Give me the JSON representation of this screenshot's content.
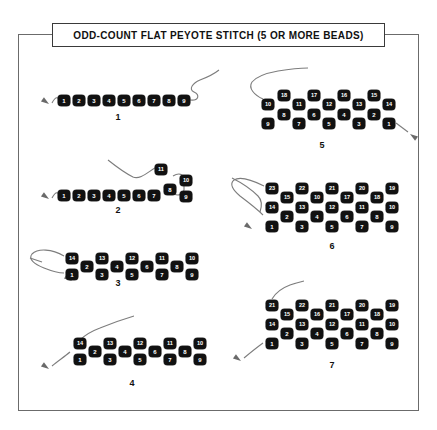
{
  "page": {
    "title": "ODD-COUNT FLAT PEYOTE STITCH (5 OR MORE BEADS)",
    "background_color": "#ffffff",
    "frame_color": "#6b6b6b",
    "bead_color": "#111111",
    "bead_label_color": "#ffffff",
    "thread_color": "#7d7d7d"
  },
  "steps": [
    {
      "number": "1",
      "label_x": 106,
      "label_y": 112,
      "beads": [
        {
          "n": "1",
          "x": 58,
          "y": 95
        },
        {
          "n": "2",
          "x": 73,
          "y": 95
        },
        {
          "n": "3",
          "x": 88,
          "y": 95
        },
        {
          "n": "4",
          "x": 103,
          "y": 95
        },
        {
          "n": "5",
          "x": 118,
          "y": 95
        },
        {
          "n": "6",
          "x": 133,
          "y": 95
        },
        {
          "n": "7",
          "x": 148,
          "y": 95
        },
        {
          "n": "8",
          "x": 163,
          "y": 95
        },
        {
          "n": "9",
          "x": 178,
          "y": 95
        }
      ],
      "threads": [
        "M52,103 C54,99 56,97 58,98",
        "M190,100 C199,101 200,95 194,92 C188,89 193,83 200,80 C208,77 214,74 219,70"
      ],
      "needles": [
        {
          "x": 49,
          "y": 104,
          "angle": 215
        }
      ]
    },
    {
      "number": "2",
      "label_x": 106,
      "label_y": 205,
      "beads": [
        {
          "n": "1",
          "x": 58,
          "y": 190
        },
        {
          "n": "2",
          "x": 73,
          "y": 190
        },
        {
          "n": "3",
          "x": 88,
          "y": 190
        },
        {
          "n": "4",
          "x": 103,
          "y": 190
        },
        {
          "n": "5",
          "x": 118,
          "y": 190
        },
        {
          "n": "6",
          "x": 133,
          "y": 190
        },
        {
          "n": "7",
          "x": 148,
          "y": 190
        },
        {
          "n": "8",
          "x": 164,
          "y": 184
        },
        {
          "n": "9",
          "x": 180,
          "y": 191
        },
        {
          "n": "10",
          "x": 180,
          "y": 175
        },
        {
          "n": "11",
          "x": 155,
          "y": 164
        }
      ],
      "threads": [
        "M52,198 C54,194 56,192 58,193",
        "M108,160 C118,168 125,173 133,177 C140,180 148,172 155,168",
        "M173,176 C178,173 182,174 184,177 L184,190 C183,195 178,196 174,194"
      ],
      "needles": [
        {
          "x": 49,
          "y": 199,
          "angle": 215
        }
      ]
    },
    {
      "number": "3",
      "label_x": 106,
      "label_y": 278,
      "beads": [
        {
          "n": "14",
          "x": 66,
          "y": 253
        },
        {
          "n": "1",
          "x": 66,
          "y": 269
        },
        {
          "n": "2",
          "x": 81,
          "y": 261
        },
        {
          "n": "13",
          "x": 96,
          "y": 253
        },
        {
          "n": "3",
          "x": 96,
          "y": 269
        },
        {
          "n": "4",
          "x": 111,
          "y": 261
        },
        {
          "n": "12",
          "x": 126,
          "y": 253
        },
        {
          "n": "5",
          "x": 126,
          "y": 269
        },
        {
          "n": "6",
          "x": 141,
          "y": 261
        },
        {
          "n": "11",
          "x": 156,
          "y": 253
        },
        {
          "n": "7",
          "x": 156,
          "y": 269
        },
        {
          "n": "8",
          "x": 171,
          "y": 261
        },
        {
          "n": "10",
          "x": 186,
          "y": 253
        },
        {
          "n": "9",
          "x": 186,
          "y": 269
        }
      ],
      "threads": [
        "M64,256 C52,249 38,248 32,254 C28,259 34,264 44,268 C54,272 60,273 64,273",
        "M30,258 L42,262"
      ],
      "needles": [
        {
          "x": 72,
          "y": 281,
          "angle": 215
        }
      ]
    },
    {
      "number": "4",
      "label_x": 120,
      "label_y": 378,
      "beads": [
        {
          "n": "14",
          "x": 74,
          "y": 338
        },
        {
          "n": "1",
          "x": 74,
          "y": 354
        },
        {
          "n": "2",
          "x": 89,
          "y": 346
        },
        {
          "n": "13",
          "x": 104,
          "y": 338
        },
        {
          "n": "3",
          "x": 104,
          "y": 354
        },
        {
          "n": "4",
          "x": 119,
          "y": 346
        },
        {
          "n": "12",
          "x": 134,
          "y": 338
        },
        {
          "n": "5",
          "x": 134,
          "y": 354
        },
        {
          "n": "6",
          "x": 149,
          "y": 346
        },
        {
          "n": "11",
          "x": 164,
          "y": 338
        },
        {
          "n": "7",
          "x": 164,
          "y": 354
        },
        {
          "n": "8",
          "x": 179,
          "y": 346
        },
        {
          "n": "10",
          "x": 194,
          "y": 338
        },
        {
          "n": "9",
          "x": 194,
          "y": 354
        }
      ],
      "threads": [
        "M80,340 C86,334 92,331 100,328 C112,323 124,319 134,316",
        "M70,352 C64,357 58,361 52,366"
      ],
      "needles": [
        {
          "x": 49,
          "y": 369,
          "angle": 215
        }
      ]
    },
    {
      "number": "5",
      "label_x": 310,
      "label_y": 140,
      "beads": [
        {
          "n": "10",
          "x": 262,
          "y": 99
        },
        {
          "n": "9",
          "x": 262,
          "y": 118
        },
        {
          "n": "18",
          "x": 278,
          "y": 90
        },
        {
          "n": "8",
          "x": 278,
          "y": 109
        },
        {
          "n": "11",
          "x": 293,
          "y": 99
        },
        {
          "n": "7",
          "x": 293,
          "y": 118
        },
        {
          "n": "17",
          "x": 308,
          "y": 90
        },
        {
          "n": "6",
          "x": 308,
          "y": 109
        },
        {
          "n": "12",
          "x": 323,
          "y": 99
        },
        {
          "n": "5",
          "x": 323,
          "y": 118
        },
        {
          "n": "16",
          "x": 338,
          "y": 90
        },
        {
          "n": "4",
          "x": 338,
          "y": 109
        },
        {
          "n": "13",
          "x": 353,
          "y": 99
        },
        {
          "n": "3",
          "x": 353,
          "y": 118
        },
        {
          "n": "15",
          "x": 368,
          "y": 90
        },
        {
          "n": "2",
          "x": 368,
          "y": 109
        },
        {
          "n": "14",
          "x": 383,
          "y": 99
        },
        {
          "n": "1",
          "x": 383,
          "y": 118
        }
      ],
      "threads": [
        "M263,99 C254,95 248,88 252,82 C257,76 267,73 278,71 C290,69 300,68 308,68",
        "M396,123 C400,126 404,129 408,132"
      ],
      "needles": [
        {
          "x": 410,
          "y": 134,
          "angle": 35
        }
      ]
    },
    {
      "number": "6",
      "label_x": 320,
      "label_y": 241,
      "beads": [
        {
          "n": "23",
          "x": 266,
          "y": 183
        },
        {
          "n": "14",
          "x": 266,
          "y": 202
        },
        {
          "n": "1",
          "x": 266,
          "y": 221
        },
        {
          "n": "15",
          "x": 281,
          "y": 192
        },
        {
          "n": "2",
          "x": 281,
          "y": 211
        },
        {
          "n": "22",
          "x": 296,
          "y": 183
        },
        {
          "n": "13",
          "x": 296,
          "y": 202
        },
        {
          "n": "3",
          "x": 296,
          "y": 221
        },
        {
          "n": "10",
          "x": 311,
          "y": 192
        },
        {
          "n": "4",
          "x": 311,
          "y": 211
        },
        {
          "n": "21",
          "x": 326,
          "y": 183
        },
        {
          "n": "12",
          "x": 326,
          "y": 202
        },
        {
          "n": "5",
          "x": 326,
          "y": 221
        },
        {
          "n": "17",
          "x": 341,
          "y": 192
        },
        {
          "n": "6",
          "x": 341,
          "y": 211
        },
        {
          "n": "20",
          "x": 356,
          "y": 183
        },
        {
          "n": "11",
          "x": 356,
          "y": 202
        },
        {
          "n": "7",
          "x": 356,
          "y": 221
        },
        {
          "n": "18",
          "x": 371,
          "y": 192
        },
        {
          "n": "8",
          "x": 371,
          "y": 211
        },
        {
          "n": "19",
          "x": 386,
          "y": 183
        },
        {
          "n": "10",
          "x": 386,
          "y": 202
        },
        {
          "n": "9",
          "x": 386,
          "y": 221
        }
      ],
      "threads": [
        "M264,186 C252,180 240,176 234,180 C229,184 233,190 240,196 C248,202 256,208 263,215",
        "M232,178 C240,182 250,188 258,196 C262,200 262,206 260,212"
      ],
      "needles": [
        {
          "x": 252,
          "y": 229,
          "angle": 215
        }
      ]
    },
    {
      "number": "7",
      "label_x": 320,
      "label_y": 360,
      "beads": [
        {
          "n": "21",
          "x": 266,
          "y": 300
        },
        {
          "n": "14",
          "x": 266,
          "y": 319
        },
        {
          "n": "1",
          "x": 266,
          "y": 338
        },
        {
          "n": "15",
          "x": 281,
          "y": 309
        },
        {
          "n": "2",
          "x": 281,
          "y": 328
        },
        {
          "n": "22",
          "x": 296,
          "y": 300
        },
        {
          "n": "13",
          "x": 296,
          "y": 319
        },
        {
          "n": "3",
          "x": 296,
          "y": 338
        },
        {
          "n": "16",
          "x": 311,
          "y": 309
        },
        {
          "n": "4",
          "x": 311,
          "y": 328
        },
        {
          "n": "21",
          "x": 326,
          "y": 300
        },
        {
          "n": "12",
          "x": 326,
          "y": 319
        },
        {
          "n": "5",
          "x": 326,
          "y": 338
        },
        {
          "n": "17",
          "x": 341,
          "y": 309
        },
        {
          "n": "6",
          "x": 341,
          "y": 328
        },
        {
          "n": "20",
          "x": 356,
          "y": 300
        },
        {
          "n": "11",
          "x": 356,
          "y": 319
        },
        {
          "n": "7",
          "x": 356,
          "y": 338
        },
        {
          "n": "18",
          "x": 371,
          "y": 309
        },
        {
          "n": "8",
          "x": 371,
          "y": 328
        },
        {
          "n": "19",
          "x": 386,
          "y": 300
        },
        {
          "n": "10",
          "x": 386,
          "y": 319
        },
        {
          "n": "9",
          "x": 386,
          "y": 338
        }
      ],
      "threads": [
        "M272,299 C276,292 282,288 290,285 C296,283 300,282 304,281",
        "M263,343 C256,348 250,353 244,358"
      ],
      "needles": [
        {
          "x": 241,
          "y": 361,
          "angle": 215
        }
      ]
    }
  ]
}
